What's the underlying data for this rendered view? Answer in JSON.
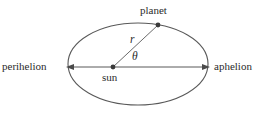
{
  "figure": {
    "type": "orbital-diagram",
    "background_color": "#ffffff",
    "stroke_color": "#595959",
    "text_color": "#2b2b2b"
  },
  "labels": {
    "perihelion": "perihelion",
    "aphelion": "aphelion",
    "planet": "planet",
    "sun": "sun",
    "radius": "r",
    "angle": "θ"
  },
  "geometry": {
    "ellipse": {
      "center_x": 138,
      "center_y": 64,
      "radius_x": 70,
      "radius_y": 41
    },
    "major_axis": {
      "x1": 68,
      "y1": 67,
      "x2": 208,
      "y2": 67
    },
    "sun_point": {
      "x": 113,
      "y": 67
    },
    "planet_point": {
      "x": 158,
      "y": 25
    },
    "perihelion_point": {
      "x": 68,
      "y": 67
    },
    "aphelion_point": {
      "x": 208,
      "y": 67
    },
    "radius_line": {
      "x1": 113,
      "y1": 67,
      "x2": 158,
      "y2": 25
    }
  }
}
